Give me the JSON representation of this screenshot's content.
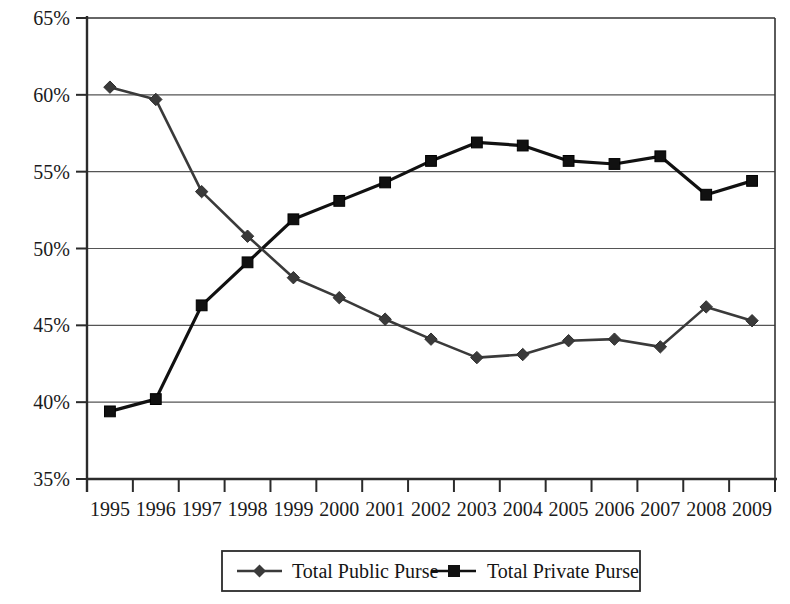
{
  "chart_data": {
    "type": "line",
    "title": "",
    "xlabel": "",
    "ylabel": "",
    "categories": [
      "1995",
      "1996",
      "1997",
      "1998",
      "1999",
      "2000",
      "2001",
      "2002",
      "2003",
      "2004",
      "2005",
      "2006",
      "2007",
      "2008",
      "2009"
    ],
    "series": [
      {
        "name": "Total Public Purse",
        "marker": "diamond",
        "color": "#3a3a3a",
        "values": [
          60.5,
          59.7,
          53.7,
          50.8,
          48.1,
          46.8,
          45.4,
          44.1,
          42.9,
          43.1,
          44.0,
          44.1,
          43.6,
          46.2,
          45.3
        ]
      },
      {
        "name": "Total Private Purse",
        "marker": "square",
        "color": "#111111",
        "values": [
          39.4,
          40.2,
          46.3,
          49.1,
          51.9,
          53.1,
          54.3,
          55.7,
          56.9,
          56.7,
          55.7,
          55.5,
          56.0,
          53.5,
          54.4
        ]
      }
    ],
    "ylim": [
      35,
      65
    ],
    "y_ticks": [
      "35%",
      "40%",
      "45%",
      "50%",
      "55%",
      "60%",
      "65%"
    ],
    "y_tick_values": [
      35,
      40,
      45,
      50,
      55,
      60,
      65
    ],
    "grid": true,
    "legend_position": "bottom"
  },
  "legend": {
    "items": [
      {
        "label": "Total Public Purse",
        "marker": "diamond-marker",
        "color": "#3a3a3a"
      },
      {
        "label": "Total Private Purse",
        "marker": "square-marker",
        "color": "#111111"
      }
    ]
  },
  "caption": {
    "text": ""
  }
}
